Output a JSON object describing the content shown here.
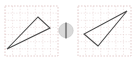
{
  "canvas": {
    "width": 134,
    "height": 62,
    "background": "#ffffff"
  },
  "diagram": {
    "type": "geometric-reflection",
    "stroke_color": "#4a4a4a",
    "grid_color": "#e3cccc",
    "frame_color": "#d8b8b8"
  },
  "panels": [
    {
      "name": "left-panel",
      "label": "Original",
      "frame": {
        "x": 5,
        "y": 6,
        "width": 53,
        "height": 50
      },
      "grid": {
        "columns": 7,
        "rows": 7,
        "cell_width": 7.57,
        "cell_height": 7.14,
        "visible": true
      },
      "shape": {
        "name": "triangle-original",
        "sides": 3,
        "points": "7,49 38,17 50,28",
        "vertices": [
          {
            "label": "A",
            "x": 7,
            "y": 49
          },
          {
            "label": "B",
            "x": 38,
            "y": 17
          },
          {
            "label": "C",
            "x": 50,
            "y": 28
          }
        ]
      }
    },
    {
      "name": "right-panel",
      "label": "Reflected",
      "frame": {
        "x": 78,
        "y": 6,
        "width": 53,
        "height": 50
      },
      "grid": {
        "columns": 7,
        "rows": 7,
        "cell_width": 7.57,
        "cell_height": 7.14,
        "visible": true
      },
      "shape": {
        "name": "triangle-reflected",
        "sides": 3,
        "points": "127,11 84,34 98,46",
        "vertices": [
          {
            "label": "A'",
            "x": 127,
            "y": 11
          },
          {
            "label": "B'",
            "x": 84,
            "y": 34
          },
          {
            "label": "C'",
            "x": 98,
            "y": 46
          }
        ]
      }
    }
  ],
  "mirror_widget": {
    "name": "mirror-axis-widget",
    "center_x": 66,
    "center_y": 30.5,
    "radius": 7.2,
    "disc_color": "#d9d9d9",
    "line_color": "#3c3c3c",
    "line_top_y": 22.5,
    "line_bottom_y": 38.5,
    "icon": "mirror-axis-icon"
  }
}
